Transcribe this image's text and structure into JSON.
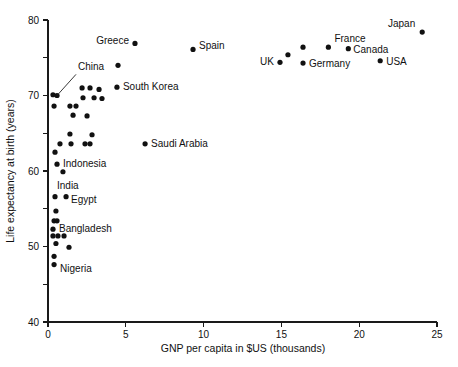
{
  "chart_data": {
    "type": "scatter",
    "title": "",
    "xlabel": "GNP per capita in $US (thousands)",
    "ylabel": "Life expectancy at birth (years)",
    "xlim": [
      0,
      25
    ],
    "ylim": [
      40,
      80
    ],
    "xticks": [
      0,
      5,
      10,
      15,
      20,
      25
    ],
    "xtick_labels": [
      "0",
      "5",
      "10",
      "15",
      "20",
      "25"
    ],
    "yticks": [
      40,
      45,
      50,
      55,
      60,
      65,
      70,
      75,
      80
    ],
    "ytick_labels": [
      "40",
      "",
      "50",
      "",
      "60",
      "",
      "70",
      "",
      "80"
    ],
    "grid": false,
    "legend": "none",
    "points": [
      {
        "label": "Japan",
        "x": 24.05,
        "y": 78.4,
        "label_dx": -7,
        "label_dy": -5,
        "anchor": "end"
      },
      {
        "label": "Greece",
        "x": 5.59,
        "y": 76.9,
        "label_dx": -6,
        "label_dy": 1,
        "anchor": "end"
      },
      {
        "label": "Spain",
        "x": 9.32,
        "y": 76.1,
        "label_dx": 6,
        "label_dy": 0,
        "anchor": "start"
      },
      {
        "label": "France",
        "x": 18.02,
        "y": 76.4,
        "label_dx": 6,
        "label_dy": -5,
        "anchor": "start"
      },
      {
        "label": "Canada",
        "x": 19.3,
        "y": 76.2,
        "label_dx": 5,
        "label_dy": 4,
        "anchor": "start"
      },
      {
        "label": "",
        "x": 16.39,
        "y": 76.4,
        "label_dx": 0,
        "label_dy": 0,
        "anchor": "start"
      },
      {
        "label": "",
        "x": 15.42,
        "y": 75.4,
        "label_dx": 0,
        "label_dy": 0,
        "anchor": "start"
      },
      {
        "label": "UK",
        "x": 14.91,
        "y": 74.4,
        "label_dx": -6,
        "label_dy": 3,
        "anchor": "end"
      },
      {
        "label": "Germany",
        "x": 16.39,
        "y": 74.3,
        "label_dx": 6,
        "label_dy": 4,
        "anchor": "start"
      },
      {
        "label": "USA",
        "x": 21.35,
        "y": 74.6,
        "label_dx": 6,
        "label_dy": 4,
        "anchor": "start"
      },
      {
        "label": "",
        "x": 4.5,
        "y": 74.0,
        "label_dx": 0,
        "label_dy": 0,
        "anchor": "start"
      },
      {
        "label": "South Korea",
        "x": 4.43,
        "y": 71.1,
        "label_dx": 6,
        "label_dy": 3,
        "anchor": "start"
      },
      {
        "label": "Saudi Arabia",
        "x": 6.24,
        "y": 63.6,
        "label_dx": 6,
        "label_dy": 3,
        "anchor": "start"
      },
      {
        "label": "China",
        "x": 0.58,
        "y": 70.0,
        "label_dx": 0,
        "label_dy": 0,
        "anchor": "start",
        "leader": {
          "to_x": 1.8,
          "to_y": 72.8
        }
      },
      {
        "label": "",
        "x": 0.32,
        "y": 70.1,
        "label_dx": 0,
        "label_dy": 0,
        "anchor": "start"
      },
      {
        "label": "",
        "x": 0.39,
        "y": 68.6,
        "label_dx": 0,
        "label_dy": 0,
        "anchor": "start"
      },
      {
        "label": "",
        "x": 1.41,
        "y": 68.6,
        "label_dx": 0,
        "label_dy": 0,
        "anchor": "start"
      },
      {
        "label": "",
        "x": 1.8,
        "y": 68.6,
        "label_dx": 0,
        "label_dy": 0,
        "anchor": "start"
      },
      {
        "label": "",
        "x": 1.61,
        "y": 67.4,
        "label_dx": 0,
        "label_dy": 0,
        "anchor": "start"
      },
      {
        "label": "",
        "x": 2.51,
        "y": 67.3,
        "label_dx": 0,
        "label_dy": 0,
        "anchor": "start"
      },
      {
        "label": "",
        "x": 2.19,
        "y": 71.0,
        "label_dx": 0,
        "label_dy": 0,
        "anchor": "start"
      },
      {
        "label": "",
        "x": 2.7,
        "y": 71.0,
        "label_dx": 0,
        "label_dy": 0,
        "anchor": "start"
      },
      {
        "label": "",
        "x": 3.28,
        "y": 70.8,
        "label_dx": 0,
        "label_dy": 0,
        "anchor": "start"
      },
      {
        "label": "",
        "x": 2.25,
        "y": 69.7,
        "label_dx": 0,
        "label_dy": 0,
        "anchor": "start"
      },
      {
        "label": "",
        "x": 2.96,
        "y": 69.7,
        "label_dx": 0,
        "label_dy": 0,
        "anchor": "start"
      },
      {
        "label": "",
        "x": 3.47,
        "y": 69.6,
        "label_dx": 0,
        "label_dy": 0,
        "anchor": "start"
      },
      {
        "label": "",
        "x": 1.41,
        "y": 64.9,
        "label_dx": 0,
        "label_dy": 0,
        "anchor": "start"
      },
      {
        "label": "",
        "x": 0.77,
        "y": 63.6,
        "label_dx": 0,
        "label_dy": 0,
        "anchor": "start"
      },
      {
        "label": "",
        "x": 1.48,
        "y": 63.6,
        "label_dx": 0,
        "label_dy": 0,
        "anchor": "start"
      },
      {
        "label": "",
        "x": 2.38,
        "y": 63.6,
        "label_dx": 0,
        "label_dy": 0,
        "anchor": "start"
      },
      {
        "label": "",
        "x": 2.7,
        "y": 63.6,
        "label_dx": 0,
        "label_dy": 0,
        "anchor": "start"
      },
      {
        "label": "",
        "x": 2.83,
        "y": 64.8,
        "label_dx": 0,
        "label_dy": 0,
        "anchor": "start"
      },
      {
        "label": "",
        "x": 0.45,
        "y": 62.5,
        "label_dx": 0,
        "label_dy": 0,
        "anchor": "start"
      },
      {
        "label": "Indonesia",
        "x": 0.58,
        "y": 60.9,
        "label_dx": 6,
        "label_dy": 3,
        "anchor": "start"
      },
      {
        "label": "",
        "x": 0.96,
        "y": 59.9,
        "label_dx": 0,
        "label_dy": 0,
        "anchor": "start"
      },
      {
        "label": "India",
        "x": 0.45,
        "y": 56.6,
        "label_dx": 2,
        "label_dy": -8,
        "anchor": "start"
      },
      {
        "label": "Egypt",
        "x": 1.16,
        "y": 56.6,
        "label_dx": 5,
        "label_dy": 6,
        "anchor": "start"
      },
      {
        "label": "",
        "x": 0.51,
        "y": 54.7,
        "label_dx": 0,
        "label_dy": 0,
        "anchor": "start"
      },
      {
        "label": "",
        "x": 0.39,
        "y": 53.4,
        "label_dx": 0,
        "label_dy": 0,
        "anchor": "start"
      },
      {
        "label": "",
        "x": 0.58,
        "y": 53.4,
        "label_dx": 0,
        "label_dy": 0,
        "anchor": "start"
      },
      {
        "label": "Bangladesh",
        "x": 0.32,
        "y": 52.3,
        "label_dx": 6,
        "label_dy": 3,
        "anchor": "start"
      },
      {
        "label": "",
        "x": 0.32,
        "y": 51.4,
        "label_dx": 0,
        "label_dy": 0,
        "anchor": "start"
      },
      {
        "label": "",
        "x": 0.64,
        "y": 51.4,
        "label_dx": 0,
        "label_dy": 0,
        "anchor": "start"
      },
      {
        "label": "",
        "x": 1.03,
        "y": 51.4,
        "label_dx": 0,
        "label_dy": 0,
        "anchor": "start"
      },
      {
        "label": "",
        "x": 0.51,
        "y": 50.4,
        "label_dx": 0,
        "label_dy": 0,
        "anchor": "start"
      },
      {
        "label": "",
        "x": 1.35,
        "y": 49.9,
        "label_dx": 0,
        "label_dy": 0,
        "anchor": "start"
      },
      {
        "label": "",
        "x": 0.39,
        "y": 48.7,
        "label_dx": 0,
        "label_dy": 0,
        "anchor": "start"
      },
      {
        "label": "Nigeria",
        "x": 0.39,
        "y": 47.6,
        "label_dx": 6,
        "label_dy": 7,
        "anchor": "start"
      }
    ]
  },
  "colors": {
    "point": "#111111",
    "axis": "#1a1a1a",
    "background": "#ffffff"
  }
}
